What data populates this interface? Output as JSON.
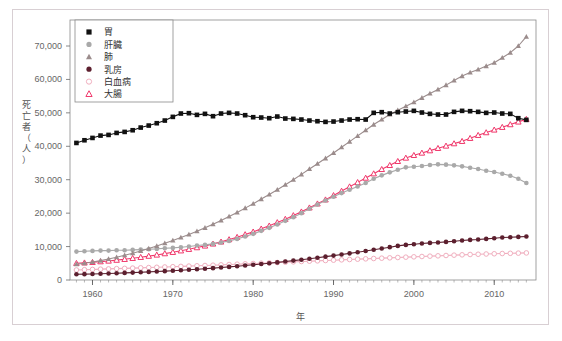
{
  "figure": {
    "frame_color": "#d8cfd3",
    "background": "#ffffff"
  },
  "axes": {
    "x_title": "年",
    "y_title": "死亡者（人）",
    "y_title_chars": [
      "死",
      "亡",
      "者",
      "（",
      "人",
      "）"
    ],
    "x_ticks": [
      "1960",
      "1970",
      "1980",
      "1990",
      "2000",
      "2010"
    ],
    "y_ticks": [
      "0",
      "10,000",
      "20,000",
      "30,000",
      "40,000",
      "50,000",
      "60,000",
      "70,000"
    ]
  },
  "legend": {
    "items": [
      {
        "label": "胃",
        "marker": "filled-square",
        "color": "#111111",
        "icon_name": "legend-marker-stomach"
      },
      {
        "label": "肝臓",
        "marker": "filled-circle",
        "color": "#a9a9a9",
        "icon_name": "legend-marker-liver"
      },
      {
        "label": "肺",
        "marker": "filled-triangle",
        "color": "#9b8c8c",
        "icon_name": "legend-marker-lung"
      },
      {
        "label": "乳房",
        "marker": "filled-circle",
        "color": "#5c1f2e",
        "icon_name": "legend-marker-breast"
      },
      {
        "label": "白血病",
        "marker": "open-circle",
        "color": "#f0aebe",
        "icon_name": "legend-marker-leukemia"
      },
      {
        "label": "大腸",
        "marker": "open-triangle",
        "color": "#f0386b",
        "icon_name": "legend-marker-colon"
      }
    ]
  },
  "chart_data": {
    "type": "line",
    "title": "",
    "xlabel": "年",
    "ylabel": "死亡者（人）",
    "xlim": [
      1957,
      2015
    ],
    "ylim": [
      0,
      75000
    ],
    "grid": false,
    "legend_position": "top-left",
    "x": [
      1958,
      1959,
      1960,
      1961,
      1962,
      1963,
      1964,
      1965,
      1966,
      1967,
      1968,
      1969,
      1970,
      1971,
      1972,
      1973,
      1974,
      1975,
      1976,
      1977,
      1978,
      1979,
      1980,
      1981,
      1982,
      1983,
      1984,
      1985,
      1986,
      1987,
      1988,
      1989,
      1990,
      1991,
      1992,
      1993,
      1994,
      1995,
      1996,
      1997,
      1998,
      1999,
      2000,
      2001,
      2002,
      2003,
      2004,
      2005,
      2006,
      2007,
      2008,
      2009,
      2010,
      2011,
      2012,
      2013,
      2014
    ],
    "series": [
      {
        "name": "胃",
        "marker": "filled-square",
        "color": "#111111",
        "values": [
          41000,
          41800,
          42500,
          43200,
          43400,
          44000,
          44300,
          44800,
          45600,
          46200,
          46900,
          47700,
          48800,
          49800,
          49900,
          49400,
          49700,
          49000,
          49800,
          50000,
          49800,
          49300,
          48700,
          48600,
          48400,
          48900,
          48300,
          48200,
          48000,
          47700,
          47500,
          47300,
          47400,
          47700,
          48000,
          48100,
          48000,
          50000,
          50200,
          49800,
          50200,
          50400,
          50600,
          50100,
          49700,
          49500,
          49500,
          50300,
          50600,
          50500,
          50300,
          50000,
          50100,
          49800,
          49700,
          48400,
          47900
        ]
      },
      {
        "name": "肝臓",
        "marker": "filled-circle",
        "color": "#a9a9a9",
        "values": [
          8500,
          8600,
          8700,
          8800,
          8800,
          8900,
          8900,
          9000,
          9100,
          9200,
          9300,
          9500,
          9600,
          9800,
          10000,
          10300,
          10500,
          10800,
          11200,
          11700,
          12300,
          13000,
          13800,
          14700,
          15600,
          16600,
          17700,
          18800,
          20000,
          21300,
          22600,
          23800,
          24900,
          26000,
          27000,
          28000,
          29000,
          30300,
          31300,
          32200,
          33000,
          33700,
          33900,
          34100,
          34400,
          34600,
          34500,
          34300,
          34000,
          33600,
          33200,
          32700,
          32300,
          31800,
          31200,
          30300,
          29000
        ]
      },
      {
        "name": "肺",
        "marker": "filled-triangle",
        "color": "#9b8c8c",
        "values": [
          4700,
          5000,
          5400,
          5800,
          6300,
          6800,
          7400,
          8000,
          8700,
          9400,
          10200,
          11000,
          11800,
          12700,
          13600,
          14600,
          15600,
          16700,
          17800,
          19000,
          20200,
          21500,
          22800,
          24200,
          25600,
          27000,
          28500,
          30000,
          31600,
          33200,
          34800,
          36400,
          38000,
          39700,
          41400,
          43100,
          44800,
          46500,
          48000,
          49500,
          50800,
          52000,
          53200,
          54500,
          55800,
          57000,
          58300,
          59700,
          61000,
          62100,
          63000,
          64000,
          65000,
          66500,
          68000,
          70000,
          72800
        ]
      },
      {
        "name": "乳房",
        "marker": "filled-circle",
        "color": "#5c1f2e",
        "values": [
          1700,
          1750,
          1800,
          1870,
          1950,
          2030,
          2120,
          2210,
          2310,
          2420,
          2530,
          2650,
          2780,
          2920,
          3070,
          3220,
          3380,
          3550,
          3730,
          3920,
          4120,
          4330,
          4550,
          4780,
          5020,
          5270,
          5530,
          5800,
          6080,
          6370,
          6670,
          6980,
          7300,
          7630,
          7970,
          8320,
          8680,
          9050,
          9430,
          9820,
          10200,
          10500,
          10700,
          10900,
          11100,
          11200,
          11400,
          11600,
          11800,
          12000,
          12100,
          12300,
          12500,
          12700,
          12800,
          12900,
          13000
        ]
      },
      {
        "name": "白血病",
        "marker": "open-circle",
        "color": "#f0aebe",
        "values": [
          3000,
          3080,
          3160,
          3240,
          3320,
          3400,
          3480,
          3560,
          3640,
          3720,
          3800,
          3890,
          3980,
          4070,
          4160,
          4250,
          4340,
          4430,
          4530,
          4630,
          4730,
          4830,
          4930,
          5030,
          5130,
          5230,
          5330,
          5430,
          5530,
          5630,
          5730,
          5830,
          5930,
          6030,
          6130,
          6230,
          6330,
          6430,
          6530,
          6630,
          6730,
          6830,
          6930,
          7030,
          7130,
          7230,
          7330,
          7430,
          7530,
          7630,
          7700,
          7780,
          7850,
          7920,
          7980,
          8040,
          8100
        ]
      },
      {
        "name": "大腸",
        "marker": "open-triangle",
        "color": "#f0386b",
        "values": [
          5000,
          5150,
          5300,
          5500,
          5700,
          5950,
          6200,
          6500,
          6800,
          7150,
          7500,
          7900,
          8300,
          8750,
          9200,
          9700,
          10200,
          10800,
          11400,
          12100,
          12800,
          13600,
          14400,
          15300,
          16200,
          17200,
          18200,
          19300,
          20400,
          21600,
          22800,
          24000,
          25300,
          26600,
          27900,
          29200,
          30500,
          31800,
          33100,
          34300,
          35500,
          36500,
          37300,
          38000,
          38700,
          39400,
          40100,
          40800,
          41500,
          42400,
          43300,
          44100,
          44900,
          45700,
          46500,
          47300,
          48100
        ]
      }
    ]
  }
}
